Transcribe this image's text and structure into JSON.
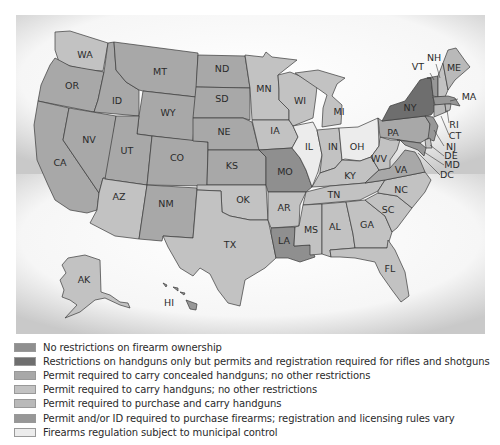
{
  "map": {
    "colors": {
      "none": "#8f8f8f",
      "handgun_only": "#6e6e6e",
      "concealed": "#a8a8a8",
      "carry": "#c2c2c2",
      "purchase_carry": "#b9b9b9",
      "purchase_id": "#979797",
      "municipal": "#ececec"
    },
    "states": {
      "WA": "WA",
      "OR": "OR",
      "CA": "CA",
      "ID": "ID",
      "NV": "NV",
      "MT": "MT",
      "WY": "WY",
      "UT": "UT",
      "AZ": "AZ",
      "CO": "CO",
      "NM": "NM",
      "ND": "ND",
      "SD": "SD",
      "NE": "NE",
      "KS": "KS",
      "OK": "OK",
      "TX": "TX",
      "MN": "MN",
      "IA": "IA",
      "MO": "MO",
      "AR": "AR",
      "LA": "LA",
      "WI": "WI",
      "IL": "IL",
      "MI": "MI",
      "IN": "IN",
      "OH": "OH",
      "KY": "KY",
      "TN": "TN",
      "MS": "MS",
      "AL": "AL",
      "GA": "GA",
      "FL": "FL",
      "SC": "SC",
      "NC": "NC",
      "VA": "VA",
      "WV": "WV",
      "PA": "PA",
      "NY": "NY",
      "VT": "VT",
      "NH": "NH",
      "ME": "ME",
      "MA": "MA",
      "RI": "RI",
      "CT": "CT",
      "NJ": "NJ",
      "DE": "DE",
      "MD": "MD",
      "DC": "DC",
      "AK": "AK",
      "HI": "HI"
    }
  },
  "legend": {
    "items": [
      {
        "label": "No restrictions on firearm ownership",
        "color": "#8f8f8f"
      },
      {
        "label": "Restrictions on handguns only but permits and registration required for rifles and shotguns",
        "color": "#6e6e6e"
      },
      {
        "label": "Permit required to carry concealed handguns; no other restrictions",
        "color": "#a8a8a8"
      },
      {
        "label": "Permit required to carry handguns; no other restrictions",
        "color": "#c2c2c2"
      },
      {
        "label": "Permit required to purchase and carry handguns",
        "color": "#b9b9b9"
      },
      {
        "label": "Permit and/or ID required to purchase firearms; registration and licensing rules vary",
        "color": "#979797"
      },
      {
        "label": "Firearms regulation subject to municipal control",
        "color": "#ececec"
      }
    ]
  }
}
